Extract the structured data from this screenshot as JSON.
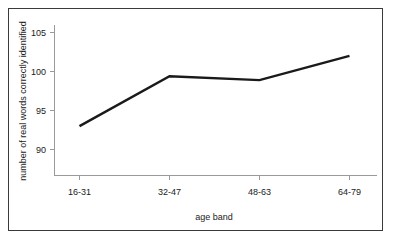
{
  "chart_data": {
    "type": "line",
    "title": "",
    "subtitle": "",
    "xlabel": "age band",
    "ylabel": "number of real words correctly identified",
    "categories": [
      "16-31",
      "32-47",
      "48-63",
      "64-79"
    ],
    "values": [
      93,
      99.4,
      98.9,
      102
    ],
    "series": [
      {
        "name": "",
        "values": [
          93,
          99.4,
          98.9,
          102
        ]
      }
    ],
    "ytick_labels": [
      "90",
      "95",
      "100",
      "105"
    ],
    "ytick_values": [
      90,
      95,
      100,
      105
    ],
    "xtick_labels": [
      "16-31",
      "32-47",
      "48-63",
      "64-79"
    ],
    "ylim": [
      85,
      106
    ],
    "grid": false,
    "legend": false,
    "legend_position": "none",
    "line_color": "#1a1a1a",
    "axis_color": "#999999",
    "border_color": "#3a3a3a",
    "background_color": "#ffffff"
  },
  "figure": {
    "border_color": "#3a3a3a",
    "background_color": "#ffffff"
  }
}
